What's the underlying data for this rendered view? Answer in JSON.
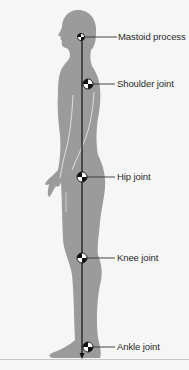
{
  "diagram": {
    "colors": {
      "background": "#f6f6f6",
      "silhouette": "#9b9b9b",
      "line": "#111111",
      "ground": "#c8c8c8",
      "label_text": "#2a2a2a"
    },
    "landmarks": [
      {
        "id": "mastoid",
        "label": "Mastoid process",
        "x": 81,
        "y": 37
      },
      {
        "id": "shoulder",
        "label": "Shoulder joint",
        "x": 88,
        "y": 84
      },
      {
        "id": "hip",
        "label": "Hip joint",
        "x": 82,
        "y": 177
      },
      {
        "id": "knee",
        "label": "Knee joint",
        "x": 82,
        "y": 258
      },
      {
        "id": "ankle",
        "label": "Ankle joint",
        "x": 88,
        "y": 347
      }
    ],
    "plumb_line": {
      "x": 82,
      "y_start": 37,
      "y_end": 358,
      "arrow": "down"
    },
    "ground_line_y": 359
  }
}
